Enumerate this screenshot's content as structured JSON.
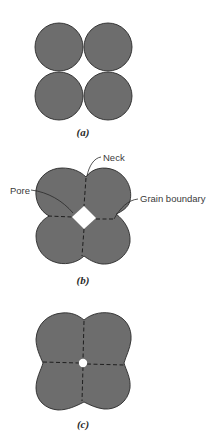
{
  "figure": {
    "colors": {
      "grain_fill": "#6d6d6d",
      "outline": "#2a2a2a",
      "pore": "#ffffff",
      "background": "#ffffff"
    },
    "panels": [
      {
        "id": "a",
        "label": "(a)",
        "description": "Four separate spherical particles in contact"
      },
      {
        "id": "b",
        "label": "(b)",
        "description": "Necks form between particles; pore and grain boundaries appear",
        "callouts": {
          "neck": "Neck",
          "pore": "Pore",
          "grain_boundary": "Grain boundary"
        }
      },
      {
        "id": "c",
        "label": "(c)",
        "description": "Further densification; small residual pore at center"
      }
    ]
  }
}
